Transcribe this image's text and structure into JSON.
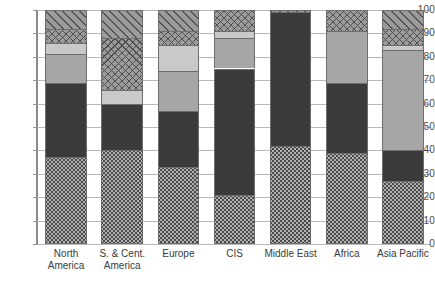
{
  "chart_data": {
    "type": "bar",
    "subtype": "stacked-bar-100",
    "title": "",
    "xlabel": "",
    "ylabel": "",
    "ylim": [
      0,
      100
    ],
    "yticks": [
      0,
      10,
      20,
      30,
      40,
      50,
      60,
      70,
      80,
      90,
      100
    ],
    "ytick_labels": [
      "0",
      "10",
      "20",
      "30",
      "40",
      "50",
      "60",
      "70",
      "80",
      "90",
      "100"
    ],
    "grid": true,
    "legend": "none",
    "categories": [
      "North America",
      "S. & Cent. America",
      "Europe",
      "CIS",
      "Middle East",
      "Africa",
      "Asia Pacific"
    ],
    "category_lines": [
      [
        "North",
        "America"
      ],
      [
        "S. & Cent.",
        "America"
      ],
      [
        "Europe",
        ""
      ],
      [
        "CIS",
        ""
      ],
      [
        "Middle East",
        ""
      ],
      [
        "Africa",
        ""
      ],
      [
        "Asia Pacific",
        ""
      ]
    ],
    "series": [
      {
        "name": "Oil",
        "fill": "dotted",
        "color": "#b0b0b0",
        "values": [
          37,
          40,
          33,
          21,
          42,
          39,
          27
        ]
      },
      {
        "name": "Natural Gas",
        "fill": "dark",
        "color": "#3b3b3b",
        "values": [
          32,
          20,
          24,
          54,
          57,
          30,
          13
        ]
      },
      {
        "name": "Coal",
        "fill": "medium",
        "color": "#a6a6a6",
        "values": [
          12,
          0,
          17,
          13,
          0,
          22,
          43
        ]
      },
      {
        "name": "Nuclear",
        "fill": "light",
        "color": "#c9c9c9",
        "values": [
          5,
          6,
          11,
          3,
          0,
          0,
          2
        ]
      },
      {
        "name": "Hydro",
        "fill": "cross",
        "color": "#9b9b9b",
        "values": [
          6,
          22,
          6,
          9,
          0,
          9,
          7
        ]
      },
      {
        "name": "Renewables",
        "fill": "diag",
        "color": "#9b9b9b",
        "values": [
          8,
          12,
          9,
          0,
          1,
          0,
          8
        ]
      }
    ]
  }
}
